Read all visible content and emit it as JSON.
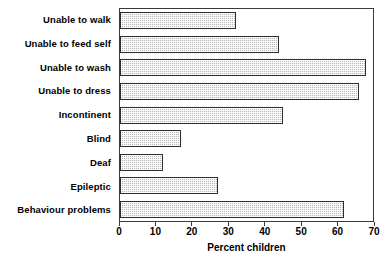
{
  "chart_data": {
    "type": "bar",
    "orientation": "horizontal",
    "title": "",
    "xlabel": "Percent children",
    "ylabel": "",
    "xlim": [
      0,
      70
    ],
    "xticks": [
      0,
      10,
      20,
      30,
      40,
      50,
      60,
      70
    ],
    "xtick_labels": [
      "0",
      "10",
      "20",
      "30",
      "40",
      "50",
      "60",
      "70"
    ],
    "grid": false,
    "legend": null,
    "categories": [
      "Unable to walk",
      "Unable to feed self",
      "Unable to wash",
      "Unable to dress",
      "Incontinent",
      "Blind",
      "Deaf",
      "Epileptic",
      "Behaviour problems"
    ],
    "values": [
      32,
      44,
      68,
      66,
      45,
      17,
      12,
      27,
      62
    ],
    "bar_color": "#b6b6b6",
    "bar_edge_color": "#2e2e2e",
    "bar_pattern": "fine-checker-hatch",
    "frame_color": "#3a3a3a"
  }
}
